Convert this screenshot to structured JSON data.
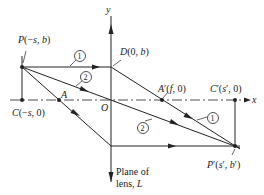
{
  "diagram": {
    "axes": {
      "x_label": "x",
      "y_label": "y"
    },
    "points": {
      "P": "P(−s, b)",
      "D": "D(0, b)",
      "C": "C(−s, 0)",
      "A": "A",
      "O": "O",
      "A_prime": "A′(f, 0)",
      "C_prime": "C′(s′, 0)",
      "P_prime": "P′(s′, b′)"
    },
    "rays": [
      {
        "id": "1",
        "label": "1"
      },
      {
        "id": "2",
        "label": "2"
      }
    ],
    "lens_label_line1": "Plane of",
    "lens_label_line2": "lens, L"
  }
}
